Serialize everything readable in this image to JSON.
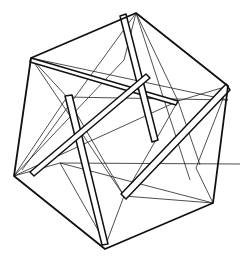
{
  "figure": {
    "stroke_color": "#111111",
    "background": "#ffffff",
    "outer_hexagon": [
      [
        136,
        13
      ],
      [
        228,
        86
      ],
      [
        213,
        203
      ],
      [
        105,
        249
      ],
      [
        14,
        176
      ],
      [
        31,
        58
      ]
    ],
    "struts": [
      {
        "from": [
          31,
          58
        ],
        "to": [
          178,
          101
        ]
      },
      {
        "from": [
          67,
          97
        ],
        "to": [
          106,
          244
        ]
      },
      {
        "from": [
          228,
          86
        ],
        "to": [
          124,
          196
        ]
      }
    ],
    "inner_nodes": [
      [
        67,
        97
      ],
      [
        178,
        101
      ],
      [
        124,
        196
      ],
      [
        196,
        168
      ],
      [
        60,
        163
      ],
      [
        145,
        83
      ]
    ]
  }
}
